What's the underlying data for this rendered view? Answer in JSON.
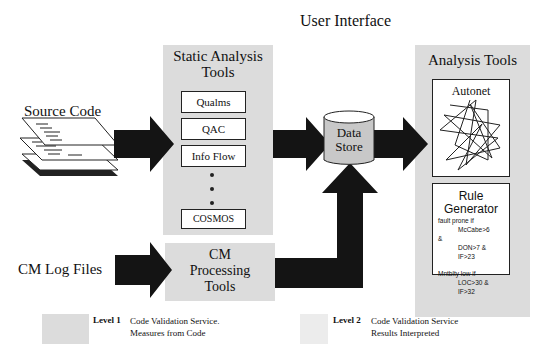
{
  "title": "User Interface",
  "inputs": {
    "source_code": "Source Code",
    "cm_log_files": "CM Log Files"
  },
  "static_analysis": {
    "title_line1": "Static Analysis",
    "title_line2": "Tools",
    "tools": [
      "Qualms",
      "QAC",
      "Info Flow",
      "COSMOS"
    ]
  },
  "cm_processing": {
    "line1": "CM",
    "line2": "Processing",
    "line3": "Tools"
  },
  "data_store": {
    "line1": "Data",
    "line2": "Store"
  },
  "analysis_tools": {
    "title": "Analysis Tools",
    "autonet": "Autonet",
    "rule_generator": {
      "title_line1": "Rule",
      "title_line2": "Generator",
      "rules": [
        "fault prone if",
        "McCabe>6",
        "&",
        "DON>7 &",
        "IF>23",
        "Mntblty low if",
        "LOC>30 &",
        "IF>32"
      ]
    }
  },
  "legend": {
    "level1": {
      "label": "Level 1",
      "line1": "Code Validation Service.",
      "line2": "Measures from Code"
    },
    "level2": {
      "label": "Level 2",
      "line1": "Code Validation Service",
      "line2": "Results Interpreted"
    }
  },
  "colors": {
    "panel": "#dcdcdc",
    "arrow": "#141414",
    "legend_level2": "#ececec"
  }
}
